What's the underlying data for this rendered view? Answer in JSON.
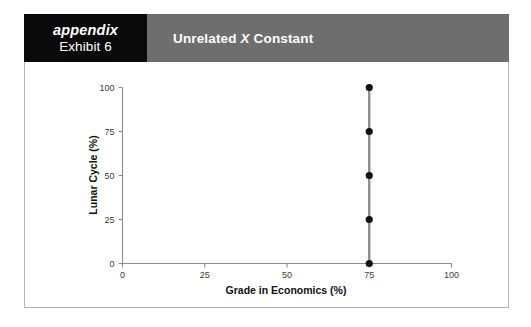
{
  "header": {
    "tag_word": "appendix",
    "tag_exhibit": "Exhibit 6",
    "title_prefix": "Unrelated",
    "title_variable": "X",
    "title_suffix": "Constant",
    "tag_bg": "#0a0a0a",
    "title_bg": "#6e6e6e",
    "title_color": "#ffffff"
  },
  "chart_data": {
    "type": "scatter",
    "title": "",
    "xlabel": "Grade in Economics (%)",
    "ylabel": "Lunar Cycle (%)",
    "xlim": [
      0,
      100
    ],
    "ylim": [
      0,
      100
    ],
    "xticks": [
      0,
      25,
      50,
      75,
      100
    ],
    "yticks": [
      0,
      25,
      50,
      75,
      100
    ],
    "xtick_labels": [
      "0",
      "25",
      "50",
      "75",
      "100"
    ],
    "ytick_labels": [
      "0",
      "25",
      "50",
      "75",
      "100"
    ],
    "grid": false,
    "legend": false,
    "series": [
      {
        "name": "Unrelated X Constant",
        "marker": "filled-circle",
        "marker_color": "#111111",
        "line_color": "#8c8c8c",
        "x": [
          75,
          75,
          75,
          75,
          75
        ],
        "y": [
          0,
          25,
          50,
          75,
          100
        ]
      }
    ]
  }
}
